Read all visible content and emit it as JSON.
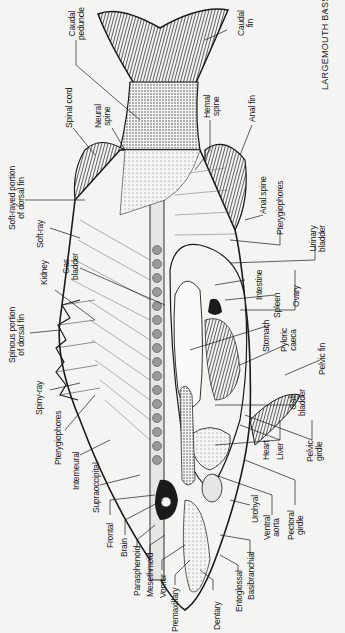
{
  "figure": {
    "title": "LARGEMOUTH BASS",
    "sex_symbol": "♀",
    "orientation": "rotated 90° counter-clockwise; head at bottom, tail at top",
    "colors": {
      "paper": "#f4f4f2",
      "ink": "#1a1a1a",
      "stipple": "#555555",
      "vertebra": "#9a9a9a"
    }
  },
  "labels": {
    "caudal_fin": "Caudal\nfin",
    "caudal_peduncle": "Caudal\npeduncle",
    "spinal_cord": "Spinal cord",
    "neural_spine": "Neural\nspine",
    "hemal_spine": "Hemal\nspine",
    "anal_fin": "Anal fin",
    "soft_rayed_dorsal": "Soft-rayed portion\nof dorsal fin",
    "soft_ray": "Soft-ray",
    "anal_spine": "Anal spine",
    "pterygiophores_top": "Pterygiophores",
    "urinary_bladder": "Urinary\nbladder",
    "gas_bladder": "Gas\nbladder",
    "kidney": "Kidney",
    "intestine": "Intestine",
    "spleen": "Spleen",
    "ovary": "Ovary",
    "spinous_dorsal": "Spinous portion\nof dorsal fin",
    "stomach": "Stomach",
    "pyloric_caeca": "Pyloric\ncaeca",
    "pelvic_fin": "Pelvic fin",
    "spiny_ray": "Spiny-ray",
    "gall_bladder": "Gall\nbladder",
    "pterygiophores_bottom": "Pterygiophores",
    "heart": "Heart",
    "liver": "Liver",
    "pelvic_girdle": "Pelvic\ngirdle",
    "interneural": "Interneural",
    "supraoccipital": "Supraoccipital",
    "frontal": "Frontal",
    "brain": "Brain",
    "parasphenoid": "Parasphenoid",
    "mesethmoid": "Mesethmoid",
    "vomer": "Vomer",
    "premaxillary": "Premaxillary",
    "dentary": "Dentary",
    "entoglossal": "Entoglossal",
    "basibranchial": "Basibranchial",
    "urohyal": "Urohyal",
    "ventral_aorta": "Ventral\naorta",
    "pectoral_girdle": "Pectoral\ngirdle"
  }
}
